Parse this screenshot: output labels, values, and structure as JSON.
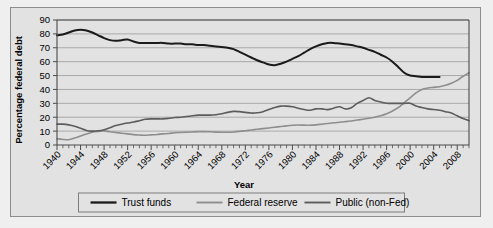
{
  "chart_data": {
    "type": "line",
    "title": "",
    "xlabel": "Year",
    "ylabel": "Percentage federal debt",
    "xlim": [
      1940,
      2010
    ],
    "ylim": [
      0,
      90
    ],
    "ytick_step": 10,
    "xtick_major_step": 4,
    "xtick_minor_step": 1,
    "grid": true,
    "legend_position": "bottom",
    "yticks": [
      "0",
      "10",
      "20",
      "30",
      "40",
      "50",
      "60",
      "70",
      "80",
      "90"
    ],
    "xticks": [
      "1940",
      "1944",
      "1948",
      "1952",
      "1956",
      "1960",
      "1964",
      "1968",
      "1972",
      "1976",
      "1980",
      "1984",
      "1988",
      "1992",
      "1996",
      "2000",
      "2004",
      "2008"
    ],
    "series": [
      {
        "name": "Trust funds",
        "color": "#1a1a1a",
        "width": 2.0,
        "x": [
          1940,
          1941,
          1942,
          1943,
          1944,
          1945,
          1946,
          1947,
          1948,
          1949,
          1950,
          1951,
          1952,
          1953,
          1954,
          1955,
          1956,
          1957,
          1958,
          1959,
          1960,
          1961,
          1962,
          1963,
          1964,
          1965,
          1966,
          1967,
          1968,
          1969,
          1970,
          1971,
          1972,
          1973,
          1974,
          1975,
          1976,
          1977,
          1978,
          1979,
          1980,
          1981,
          1982,
          1983,
          1984,
          1985,
          1986,
          1987,
          1988,
          1989,
          1990,
          1991,
          1992,
          1993,
          1994,
          1995,
          1996,
          1997,
          1998,
          1999,
          2000,
          2001,
          2002,
          2003,
          2004,
          2005
        ],
        "values": [
          79,
          79.5,
          81,
          82.5,
          83,
          82.5,
          81,
          79,
          77,
          75.5,
          75,
          75.5,
          76,
          74.5,
          73.5,
          73.5,
          73.5,
          73.5,
          73.5,
          73,
          73,
          73,
          72.5,
          72.5,
          72,
          72,
          71.5,
          71,
          70.5,
          70,
          69,
          67,
          65,
          63,
          61,
          59.5,
          58,
          57.5,
          58.5,
          60,
          62,
          64,
          66.5,
          69,
          71,
          72.5,
          73.5,
          73.5,
          73,
          72.5,
          72,
          71,
          70,
          68.5,
          67,
          65,
          63,
          60,
          56,
          52,
          50,
          49.5,
          49,
          49,
          49,
          49
        ]
      },
      {
        "name": "Federal reserve",
        "color": "#8e8e8e",
        "width": 1.6,
        "x": [
          1940,
          1941,
          1942,
          1943,
          1944,
          1945,
          1946,
          1947,
          1948,
          1949,
          1950,
          1951,
          1952,
          1953,
          1954,
          1955,
          1956,
          1957,
          1958,
          1959,
          1960,
          1961,
          1962,
          1963,
          1964,
          1965,
          1966,
          1967,
          1968,
          1969,
          1970,
          1971,
          1972,
          1973,
          1974,
          1975,
          1976,
          1977,
          1978,
          1979,
          1980,
          1981,
          1982,
          1983,
          1984,
          1985,
          1986,
          1987,
          1988,
          1989,
          1990,
          1991,
          1992,
          1993,
          1994,
          1995,
          1996,
          1997,
          1998,
          1999,
          2000,
          2001,
          2002,
          2003,
          2004,
          2005,
          2006,
          2007,
          2008,
          2009,
          2010
        ],
        "values": [
          4.5,
          4.0,
          3.8,
          5.0,
          6.5,
          8.0,
          9.2,
          9.8,
          10.2,
          9.5,
          9.0,
          8.5,
          8.0,
          7.5,
          7.2,
          7.0,
          7.3,
          7.6,
          8.0,
          8.3,
          8.8,
          9.0,
          9.2,
          9.4,
          9.6,
          9.6,
          9.5,
          9.3,
          9.2,
          9.2,
          9.4,
          9.8,
          10.3,
          10.8,
          11.3,
          11.8,
          12.3,
          12.8,
          13.3,
          13.8,
          14.2,
          14.4,
          14.3,
          14.2,
          14.5,
          15.0,
          15.5,
          16.0,
          16.4,
          16.8,
          17.3,
          18.0,
          18.5,
          19.2,
          20.0,
          21.0,
          22.5,
          24.5,
          27.0,
          30.5,
          34.0,
          37.5,
          40.0,
          41.0,
          41.5,
          42.0,
          43.0,
          44.5,
          46.5,
          49.5,
          52.0
        ]
      },
      {
        "name": "Public (non-Fed)",
        "color": "#5c5c5c",
        "width": 1.6,
        "x": [
          1940,
          1941,
          1942,
          1943,
          1944,
          1945,
          1946,
          1947,
          1948,
          1949,
          1950,
          1951,
          1952,
          1953,
          1954,
          1955,
          1956,
          1957,
          1958,
          1959,
          1960,
          1961,
          1962,
          1963,
          1964,
          1965,
          1966,
          1967,
          1968,
          1969,
          1970,
          1971,
          1972,
          1973,
          1974,
          1975,
          1976,
          1977,
          1978,
          1979,
          1980,
          1981,
          1982,
          1983,
          1984,
          1985,
          1986,
          1987,
          1988,
          1989,
          1990,
          1991,
          1992,
          1993,
          1994,
          1995,
          1996,
          1997,
          1998,
          1999,
          2000,
          2001,
          2002,
          2003,
          2004,
          2005,
          2006,
          2007,
          2008,
          2009,
          2010
        ],
        "values": [
          15.0,
          15.0,
          14.5,
          13.5,
          12.0,
          10.5,
          10.0,
          10.2,
          11.0,
          12.5,
          14.0,
          15.0,
          15.8,
          16.5,
          17.5,
          18.5,
          18.8,
          18.8,
          18.8,
          19.2,
          19.8,
          20.0,
          20.5,
          21.0,
          21.5,
          21.5,
          21.5,
          21.8,
          22.5,
          23.5,
          24.2,
          24.0,
          23.5,
          23.0,
          23.2,
          24.0,
          25.5,
          27.0,
          28.0,
          28.0,
          27.5,
          26.5,
          25.5,
          25.0,
          26.0,
          26.0,
          25.5,
          26.5,
          27.5,
          26.0,
          26.8,
          30.0,
          32.0,
          34.0,
          32.0,
          31.0,
          30.0,
          30.0,
          30.0,
          30.0,
          30.0,
          28.0,
          27.0,
          26.0,
          25.5,
          25.0,
          24.0,
          23.0,
          21.0,
          19.0,
          17.5
        ]
      }
    ]
  },
  "legend": {
    "items": [
      {
        "label": "Trust funds"
      },
      {
        "label": "Federal reserve"
      },
      {
        "label": "Public (non-Fed)"
      }
    ]
  }
}
